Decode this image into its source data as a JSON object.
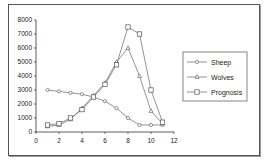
{
  "chart_data": {
    "type": "line",
    "title": "",
    "xlabel": "",
    "ylabel": "",
    "x": [
      1,
      2,
      3,
      4,
      5,
      6,
      7,
      8,
      9,
      10,
      11
    ],
    "xlim": [
      0,
      12
    ],
    "ylim": [
      0,
      8000
    ],
    "x_ticks": [
      "0",
      "2",
      "4",
      "6",
      "8",
      "10",
      "12"
    ],
    "y_ticks": [
      "0",
      "1000",
      "2000",
      "3000",
      "4000",
      "5000",
      "6000",
      "7000",
      "8000"
    ],
    "grid": false,
    "legend_position": "right",
    "series": [
      {
        "name": "Sheep",
        "marker": "circle",
        "values": [
          3000,
          2900,
          2800,
          2700,
          2500,
          2200,
          1700,
          1000,
          500,
          500,
          500
        ]
      },
      {
        "name": "Wolves",
        "marker": "triangle",
        "values": [
          400,
          500,
          900,
          1700,
          2600,
          3500,
          5000,
          6000,
          4000,
          1500,
          600
        ]
      },
      {
        "name": "Prognosis",
        "marker": "square",
        "values": [
          500,
          600,
          1000,
          1600,
          2500,
          3400,
          4800,
          7500,
          7000,
          3000,
          700
        ]
      }
    ]
  },
  "legend": {
    "items": [
      "Sheep",
      "Wolves",
      "Prognosis"
    ]
  }
}
